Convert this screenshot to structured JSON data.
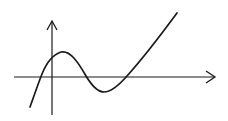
{
  "diagram": {
    "colors": {
      "stroke": "#1a1a1a",
      "background": "#ffffff"
    },
    "axes": {
      "x_axis": {
        "x1": 14,
        "y": 77,
        "x2": 216,
        "arrow": true
      },
      "y_axis": {
        "x": 52,
        "y1": 115,
        "y2": 20,
        "arrow": true
      }
    },
    "curve": {
      "points": [
        [
          30,
          107
        ],
        [
          40,
          77
        ],
        [
          52,
          58
        ],
        [
          61,
          52
        ],
        [
          86,
          77
        ],
        [
          104,
          92
        ],
        [
          127,
          77
        ],
        [
          177,
          12
        ]
      ],
      "features": [
        "x-intercept left of origin",
        "y-intercept positive",
        "local maximum",
        "x-intercept",
        "local minimum",
        "x-intercept",
        "rising to upper right"
      ]
    }
  }
}
